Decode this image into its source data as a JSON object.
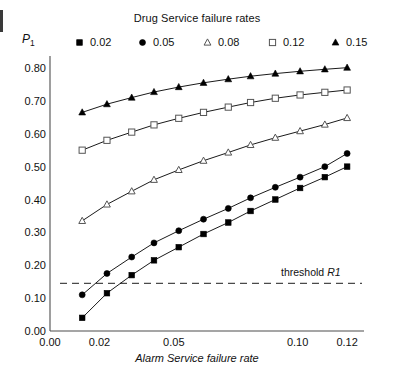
{
  "legend": {
    "title": "Drug Service failure rates",
    "items": [
      {
        "label": "0.02",
        "marker": "filled-square-marker-icon"
      },
      {
        "label": "0.05",
        "marker": "filled-circle-marker-icon"
      },
      {
        "label": "0.08",
        "marker": "open-triangle-marker-icon"
      },
      {
        "label": "0.12",
        "marker": "open-square-marker-icon"
      },
      {
        "label": "0.15",
        "marker": "filled-triangle-marker-icon"
      }
    ]
  },
  "annotations": {
    "threshold_label_text": "threshold ",
    "threshold_label_emphasis": "R1",
    "threshold_value": 0.145
  },
  "axes": {
    "y_title_main": "P",
    "y_title_sub": "1",
    "x_title": "Alarm Service failure rate"
  },
  "chart_data": {
    "type": "line",
    "title": "Drug Service failure rates",
    "xlabel": "Alarm Service failure rate",
    "ylabel": "P1",
    "xlim": [
      0.0,
      0.1252
    ],
    "ylim": [
      0.0,
      0.84
    ],
    "grid": false,
    "legend_position": "top",
    "xticks": [
      0.0,
      0.02,
      0.05,
      0.1,
      0.12
    ],
    "xticklabels": [
      "0.00",
      "0.02",
      "0.05",
      "0.10",
      "0.12"
    ],
    "yticks": [
      0.0,
      0.1,
      0.2,
      0.3,
      0.4,
      0.5,
      0.6,
      0.7,
      0.8
    ],
    "yticklabels": [
      "0.00",
      "0.10",
      "0.20",
      "0.30",
      "0.40",
      "0.50",
      "0.60",
      "0.70",
      "0.80"
    ],
    "x": [
      0.013,
      0.023,
      0.033,
      0.042,
      0.052,
      0.062,
      0.072,
      0.081,
      0.091,
      0.101,
      0.111,
      0.12
    ],
    "series": [
      {
        "name": "0.02",
        "marker": "filled-square",
        "values": [
          0.04,
          0.115,
          0.17,
          0.215,
          0.255,
          0.295,
          0.33,
          0.365,
          0.4,
          0.435,
          0.468,
          0.5
        ]
      },
      {
        "name": "0.05",
        "marker": "filled-circle",
        "values": [
          0.11,
          0.175,
          0.225,
          0.268,
          0.305,
          0.34,
          0.373,
          0.405,
          0.437,
          0.468,
          0.5,
          0.54
        ]
      },
      {
        "name": "0.08",
        "marker": "open-triangle",
        "values": [
          0.335,
          0.385,
          0.425,
          0.46,
          0.49,
          0.518,
          0.543,
          0.566,
          0.588,
          0.608,
          0.628,
          0.648
        ]
      },
      {
        "name": "0.12",
        "marker": "open-square",
        "values": [
          0.55,
          0.58,
          0.605,
          0.627,
          0.647,
          0.665,
          0.681,
          0.695,
          0.708,
          0.718,
          0.726,
          0.733
        ]
      },
      {
        "name": "0.15",
        "marker": "filled-triangle",
        "values": [
          0.665,
          0.69,
          0.71,
          0.727,
          0.742,
          0.755,
          0.766,
          0.775,
          0.783,
          0.79,
          0.796,
          0.801
        ]
      }
    ]
  }
}
